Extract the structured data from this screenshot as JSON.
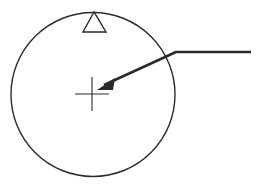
{
  "diagram": {
    "type": "symbol-with-leader",
    "background": "#ffffff",
    "stroke_color": "#2a2a2a",
    "circle": {
      "cx": 93,
      "cy": 94.5,
      "r": 82,
      "stroke_width": 1.4
    },
    "triangle_marker": {
      "points": "94,12 83,32 106,32",
      "stroke_width": 1.4,
      "fill": "#ffffff"
    },
    "center_cross": {
      "cx": 92,
      "cy": 94,
      "half_width": 17,
      "half_height": 17,
      "stroke_width": 1.1
    },
    "leader_line": {
      "points": "251,52 176,52 104,85",
      "stroke_width": 2.6,
      "arrowhead_points": "97,90 115,78 113,90"
    }
  }
}
